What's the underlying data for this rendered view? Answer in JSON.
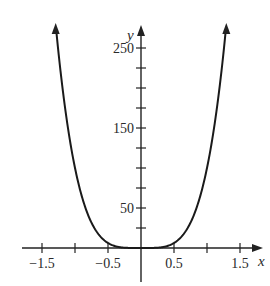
{
  "chart_data": {
    "type": "line",
    "title": "",
    "xlabel": "x",
    "ylabel": "y",
    "function": "y = 100x^4",
    "xlim": [
      -1.5,
      1.5
    ],
    "ylim": [
      0,
      280
    ],
    "x_ticks": [
      -1.5,
      -1.0,
      -0.5,
      0.5,
      1.0,
      1.5
    ],
    "x_tick_labels": [
      "−1.5",
      "−0.5",
      "0.5",
      "1.5"
    ],
    "x_tick_labels_at": [
      -1.5,
      -0.5,
      0.5,
      1.5
    ],
    "y_ticks": [
      25,
      50,
      75,
      100,
      125,
      150,
      175,
      200,
      225,
      250
    ],
    "y_tick_labels": [
      "50",
      "150",
      "250"
    ],
    "y_tick_labels_at": [
      50,
      150,
      250
    ],
    "grid": false,
    "legend": null,
    "series": [
      {
        "name": "curve",
        "x": [
          -1.29,
          -1.25,
          -1.0,
          -0.75,
          -0.5,
          -0.25,
          0,
          0.25,
          0.5,
          0.75,
          1.0,
          1.25,
          1.29
        ],
        "values": [
          277,
          244,
          100,
          31.6,
          6.25,
          0.39,
          0,
          0.39,
          6.25,
          31.6,
          100,
          244,
          277
        ]
      }
    ],
    "color": "#1a1a1a"
  }
}
